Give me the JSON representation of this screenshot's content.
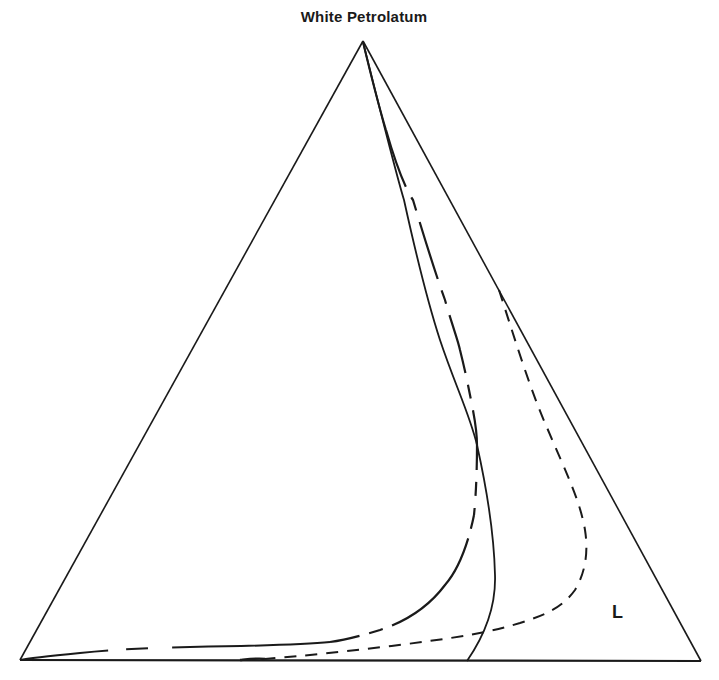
{
  "diagram": {
    "type": "ternary-phase-diagram",
    "vertices": {
      "top": "White Petrolatum",
      "bottom_left": "",
      "bottom_right": ""
    },
    "region_labels": [
      {
        "text": "L",
        "position": "lower-right, near right edge"
      }
    ],
    "curves": [
      {
        "name": "solid-boundary",
        "style": "solid",
        "description": "from apex descending to base near right third, bulging right"
      },
      {
        "name": "long-dash-boundary",
        "style": "long-dash",
        "description": "from apex descending, sweeping left along base to bottom-left vertex"
      },
      {
        "name": "short-dash-boundary",
        "style": "short-dash",
        "description": "from right edge, bulging right then sweeping left toward base"
      }
    ],
    "colors": {
      "line": "#1a1a1a",
      "background": "#ffffff"
    }
  }
}
